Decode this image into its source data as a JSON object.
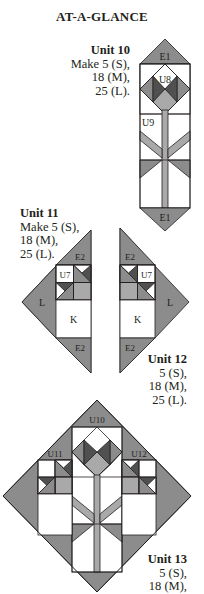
{
  "title": "AT-A-GLANCE",
  "colors": {
    "medium_gray": "#8c8c8c",
    "light_gray": "#a9a9a9",
    "dark_gray": "#505050",
    "white": "#ffffff",
    "outline": "#231f20"
  },
  "units": [
    {
      "name": "Unit 10",
      "lines": [
        "Make 5 (S),",
        "18 (M),",
        "25 (L)."
      ],
      "labels": {
        "top": "E1",
        "block": "U8",
        "stem": "U9",
        "bottom": "E1"
      }
    },
    {
      "name": "Unit 11",
      "lines": [
        "Make 5 (S),",
        "18 (M),",
        "25 (L)."
      ],
      "labels": {
        "top": "E2",
        "block": "U7",
        "side": "L",
        "square": "K",
        "bottom": "E2"
      }
    },
    {
      "name": "Unit 12",
      "lines": [
        "5 (S),",
        "18 (M),",
        "25 (L)."
      ],
      "labels": {
        "top": "E2",
        "block": "U7",
        "side": "L",
        "square": "K",
        "bottom": "E2"
      }
    },
    {
      "name": "Unit 13",
      "lines": [
        "5 (S),",
        "18 (M),"
      ],
      "labels": {
        "center": "U10",
        "left": "U11",
        "right": "U12"
      }
    }
  ]
}
